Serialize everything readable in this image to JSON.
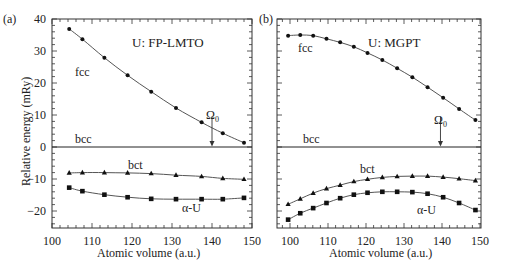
{
  "chart_data": [
    {
      "type": "line",
      "panel_label": "(a)",
      "title": "U: FP-LMTO",
      "xlabel": "Atomic volume (a.u.)",
      "ylabel": "Relative energy (mRy)",
      "xlim": [
        100,
        150
      ],
      "ylim": [
        -26,
        40
      ],
      "xticks": [
        100,
        110,
        120,
        130,
        140,
        150
      ],
      "yticks": [
        40,
        30,
        20,
        10,
        0,
        -10,
        -20
      ],
      "grid": false,
      "annotations": [
        {
          "text": "Ω0",
          "x": 140,
          "arrow_to_y": 0
        }
      ],
      "series": [
        {
          "name": "fcc",
          "marker": "circle",
          "x": [
            104.3,
            107.6,
            113.1,
            118.9,
            124.8,
            131.0,
            137.4,
            142.7,
            148.0
          ],
          "y": [
            36.9,
            33.7,
            27.9,
            22.4,
            17.3,
            12.2,
            7.7,
            4.3,
            1.3
          ]
        },
        {
          "name": "bcc",
          "marker": "none",
          "x": [
            100,
            150
          ],
          "y": [
            0,
            0
          ]
        },
        {
          "name": "bct",
          "marker": "triangle",
          "x": [
            104.3,
            107.6,
            113.1,
            118.9,
            124.8,
            131.0,
            137.4,
            142.7,
            148.0
          ],
          "y": [
            -8.1,
            -8.0,
            -8.0,
            -8.1,
            -8.3,
            -8.8,
            -9.2,
            -9.8,
            -10.1
          ]
        },
        {
          "name": "α-U",
          "marker": "square",
          "x": [
            104.3,
            107.6,
            113.1,
            118.9,
            124.8,
            131.0,
            137.4,
            142.7,
            148.0
          ],
          "y": [
            -12.7,
            -13.8,
            -14.9,
            -15.7,
            -16.2,
            -16.3,
            -16.3,
            -16.3,
            -15.9
          ]
        }
      ]
    },
    {
      "type": "line",
      "panel_label": "(b)",
      "title": "U: MGPT",
      "xlabel": "Atomic volume (a.u.)",
      "ylabel": "Relative energy (mRy)",
      "xlim": [
        96.5,
        150
      ],
      "ylim": [
        -26,
        40
      ],
      "xticks": [
        100,
        110,
        120,
        130,
        140,
        150
      ],
      "grid": false,
      "annotations": [
        {
          "text": "Ω0",
          "x": 139.6,
          "arrow_to_y": 0
        }
      ],
      "series": [
        {
          "name": "fcc",
          "marker": "circle",
          "x": [
            99.5,
            102.7,
            106.1,
            109.6,
            113.2,
            116.8,
            120.4,
            124.3,
            128.2,
            132.2,
            136.2,
            140.3,
            144.5,
            148.8
          ],
          "y": [
            34.8,
            35.0,
            34.8,
            33.8,
            32.7,
            31.3,
            29.4,
            27.2,
            24.6,
            21.8,
            18.7,
            15.4,
            11.9,
            8.4
          ]
        },
        {
          "name": "bcc",
          "marker": "none",
          "x": [
            96.5,
            150
          ],
          "y": [
            0,
            0
          ]
        },
        {
          "name": "bct",
          "marker": "triangle",
          "x": [
            99.5,
            102.7,
            106.1,
            109.6,
            113.2,
            116.8,
            120.4,
            124.3,
            128.2,
            132.2,
            136.2,
            140.3,
            144.5,
            148.8
          ],
          "y": [
            -17.9,
            -16.2,
            -14.4,
            -13.0,
            -11.9,
            -10.8,
            -10.1,
            -9.5,
            -9.2,
            -9.1,
            -9.1,
            -9.4,
            -9.9,
            -10.5
          ]
        },
        {
          "name": "α-U",
          "marker": "square",
          "x": [
            99.5,
            102.7,
            106.1,
            109.6,
            113.2,
            116.8,
            120.4,
            124.3,
            128.2,
            132.2,
            136.2,
            140.3,
            144.5,
            148.8
          ],
          "y": [
            -22.7,
            -20.7,
            -19.1,
            -17.5,
            -16.0,
            -14.9,
            -14.3,
            -14.0,
            -14.0,
            -14.1,
            -14.6,
            -15.7,
            -17.5,
            -19.7
          ]
        }
      ]
    }
  ],
  "labels": {
    "panel_a": "(a)",
    "panel_b": "(b)",
    "title_a": "U: FP-LMTO",
    "title_b": "U: MGPT",
    "ylabel": "Relative energy (mRy)",
    "xlabel": "Atomic volume (a.u.)",
    "fcc": "fcc",
    "bcc": "bcc",
    "bct": "bct",
    "alpha": "α-U",
    "omega": "Ω",
    "omega_sub": "0"
  },
  "ticks": {
    "y": [
      "40",
      "30",
      "20",
      "10",
      "0",
      "-10",
      "-20"
    ],
    "x": [
      "100",
      "110",
      "120",
      "130",
      "140",
      "150"
    ]
  }
}
